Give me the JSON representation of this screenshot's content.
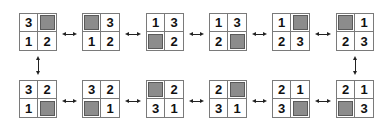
{
  "diagram": {
    "title": "",
    "blank_color": "#8c8c8c",
    "top_row": [
      {
        "cells": [
          "3",
          "",
          "1",
          "2"
        ]
      },
      {
        "cells": [
          "",
          "3",
          "1",
          "2"
        ]
      },
      {
        "cells": [
          "1",
          "3",
          "",
          "2"
        ]
      },
      {
        "cells": [
          "1",
          "3",
          "2",
          ""
        ]
      },
      {
        "cells": [
          "1",
          "",
          "2",
          "3"
        ]
      },
      {
        "cells": [
          "",
          "1",
          "2",
          "3"
        ]
      }
    ],
    "bottom_row": [
      {
        "cells": [
          "3",
          "2",
          "1",
          ""
        ]
      },
      {
        "cells": [
          "3",
          "2",
          "",
          "1"
        ]
      },
      {
        "cells": [
          "",
          "2",
          "3",
          "1"
        ]
      },
      {
        "cells": [
          "2",
          "",
          "3",
          "1"
        ]
      },
      {
        "cells": [
          "2",
          "1",
          "3",
          ""
        ]
      },
      {
        "cells": [
          "2",
          "1",
          "",
          "3"
        ]
      }
    ],
    "connections": "bidirectional arrows between horizontally adjacent states; vertical bidirectional arrows at left and right ends joining the two rows"
  }
}
